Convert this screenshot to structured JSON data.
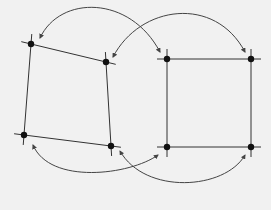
{
  "diagram": {
    "colors": {
      "background": "#f1f1f1",
      "stroke": "#333333",
      "vertex": "#111111",
      "arrow": "#444444"
    },
    "shapes": [
      {
        "id": "quadrilateral",
        "vertices": [
          [
            31,
            44
          ],
          [
            106,
            62
          ],
          [
            111,
            146
          ],
          [
            24,
            135
          ]
        ]
      },
      {
        "id": "square",
        "vertices": [
          [
            167,
            59
          ],
          [
            251,
            59
          ],
          [
            251,
            147
          ],
          [
            167,
            147
          ]
        ]
      }
    ],
    "arrows": [
      {
        "id": "top-tl",
        "d": "M 160 52 C 130 -5, 60 -5, 40 38",
        "from": "square-TL",
        "to": "quad-TL",
        "heads": "both"
      },
      {
        "id": "top-tr",
        "d": "M 113 57 C 140 5, 215 -5, 245 52",
        "from": "quad-TR",
        "to": "square-TR",
        "heads": "both"
      },
      {
        "id": "bottom-bl",
        "d": "M 33 145 C 50 185, 130 175, 158 155",
        "from": "quad-BL",
        "to": "square-BL",
        "heads": "both"
      },
      {
        "id": "bottom-br",
        "d": "M 120 151 C 145 195, 225 190, 245 155",
        "from": "quad-BR",
        "to": "square-BR",
        "heads": "both"
      }
    ]
  }
}
